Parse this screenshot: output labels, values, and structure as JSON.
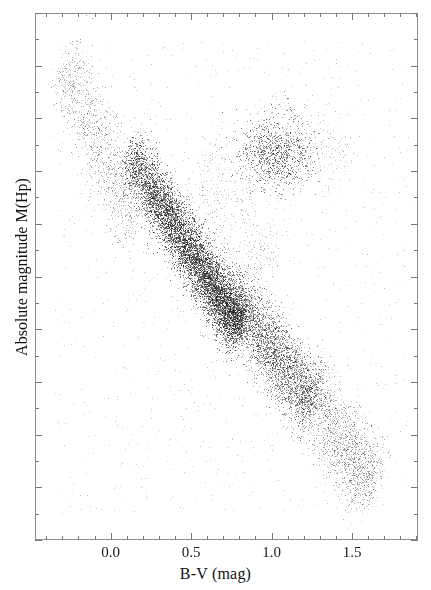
{
  "figure": {
    "title": "",
    "background_color": "#ffffff",
    "frame_color": "#8e8e8e",
    "point_color": "#3c3c3c"
  },
  "axes": {
    "x_axis_title": "B-V (mag)",
    "y_axis_title": "Absolute magnitude M(Hp)",
    "x_tick_labels": [
      "0.0",
      "0.5",
      "1.0",
      "1.5"
    ],
    "y_tick_labels": []
  },
  "chart_data": {
    "type": "scatter",
    "title": "",
    "xlabel": "B-V (mag)",
    "ylabel": "Absolute magnitude M(Hp)",
    "xlim": [
      -0.47,
      1.91
    ],
    "ylim_note": "Absolute magnitude axis increases downward; no numeric tick labels are printed on the y-axis in this figure",
    "xticks": [
      0.0,
      0.5,
      1.0,
      1.5
    ],
    "xtick_minor_step": 0.1,
    "yticks_count": 21,
    "grid": false,
    "legend": null,
    "point_count_approx": 16000,
    "marker": "dot",
    "marker_size_px": 1,
    "populations": [
      {
        "name": "upper-main-sequence",
        "n": 1100,
        "comment": "hot blue stars, sparse, upper-left",
        "x_range": [
          -0.3,
          0.15
        ],
        "y_frac_range": [
          0.09,
          0.4
        ],
        "spread": 0.055
      },
      {
        "name": "main-sequence-core",
        "n": 7200,
        "comment": "densest band, turn-off through solar colours",
        "x_range": [
          0.1,
          0.8
        ],
        "y_frac_range": [
          0.26,
          0.6
        ],
        "spread": 0.04
      },
      {
        "name": "lower-main-sequence",
        "n": 3400,
        "comment": "K dwarfs sloping down to the right",
        "x_range": [
          0.7,
          1.25
        ],
        "y_frac_range": [
          0.52,
          0.74
        ],
        "spread": 0.05
      },
      {
        "name": "m-dwarf-tail",
        "n": 1500,
        "comment": "steep faint red tail, thins toward bottom right",
        "x_range": [
          1.2,
          1.62
        ],
        "y_frac_range": [
          0.7,
          0.9
        ],
        "spread": 0.055
      },
      {
        "name": "red-clump-giants",
        "n": 900,
        "comment": "red horizontal-branch / clump overdensity",
        "x_center": 1.02,
        "y_frac_center": 0.265,
        "x_sigma": 0.115,
        "y_sigma": 0.035
      },
      {
        "name": "giant-branch-spur",
        "n": 260,
        "comment": "faint rise above the clump toward redder colours",
        "x_range": [
          0.95,
          1.45
        ],
        "y_frac_range": [
          0.18,
          0.3
        ],
        "spread": 0.05
      },
      {
        "name": "subgiant-bridge",
        "n": 420,
        "comment": "sparse stars between main sequence and clump",
        "x_range": [
          0.55,
          1.0
        ],
        "y_frac_range": [
          0.28,
          0.5
        ],
        "spread": 0.08
      },
      {
        "name": "field-scatter",
        "n": 900,
        "comment": "sparse outliers spread across the frame",
        "x_range": [
          -0.35,
          1.85
        ],
        "y_frac_range": [
          0.05,
          0.95
        ],
        "spread": 0.5
      }
    ]
  }
}
